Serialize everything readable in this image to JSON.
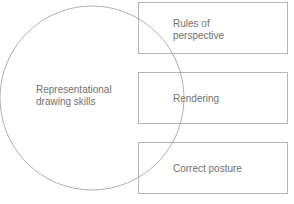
{
  "diagram": {
    "circle": {
      "label": "Representational\ndrawing skills",
      "stroke": "#9a9a9a"
    },
    "boxes": [
      {
        "label": "Rules of\nperspective"
      },
      {
        "label": "Rendering"
      },
      {
        "label": "Correct posture"
      }
    ],
    "box_stroke": "#b4b4b4",
    "text_color": "#707070"
  }
}
